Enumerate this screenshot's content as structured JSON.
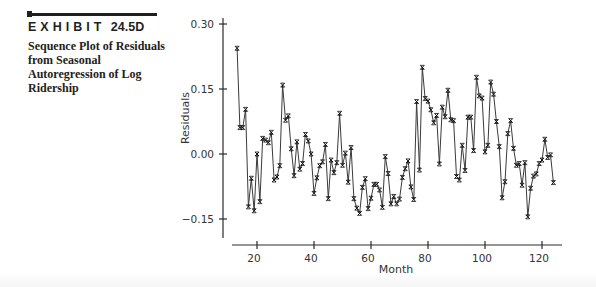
{
  "exhibit": {
    "word": "EXHIBIT",
    "number": "24.5D",
    "caption": "Sequence Plot of Residuals from Seasonal Autoregression of Log Ridership"
  },
  "chart_data": {
    "type": "line",
    "title": "Sequence Plot of Residuals from Seasonal Autoregression of Log Ridership",
    "xlabel": "Month",
    "ylabel": "Residuals",
    "xlim": [
      10,
      129
    ],
    "ylim": [
      -0.195,
      0.31
    ],
    "x_ticks": [
      20,
      40,
      60,
      80,
      100,
      120
    ],
    "x_tick_labels": [
      "20",
      "40",
      "60",
      "80",
      "100",
      "120"
    ],
    "y_ticks": [
      0.3,
      0.15,
      0.0,
      -0.15
    ],
    "y_tick_labels": [
      "0.30",
      "0.15",
      "0.00",
      "−0.15"
    ],
    "grid": false,
    "legend": null,
    "marker": "x",
    "series": [
      {
        "name": "Residuals",
        "x_start": 13,
        "x_step": 1,
        "values": [
          0.244,
          0.061,
          0.061,
          0.103,
          -0.122,
          -0.056,
          -0.131,
          0.0,
          -0.11,
          0.036,
          0.032,
          0.026,
          0.05,
          -0.06,
          -0.053,
          -0.027,
          0.159,
          0.078,
          0.088,
          0.012,
          -0.05,
          0.028,
          -0.035,
          -0.022,
          0.045,
          0.03,
          0.0,
          -0.091,
          -0.055,
          -0.027,
          -0.018,
          0.022,
          -0.103,
          -0.014,
          -0.043,
          -0.02,
          0.094,
          -0.026,
          0.002,
          -0.065,
          0.015,
          -0.103,
          -0.125,
          -0.137,
          -0.077,
          -0.057,
          -0.126,
          -0.102,
          -0.07,
          -0.07,
          -0.083,
          -0.123,
          -0.006,
          -0.045,
          -0.115,
          -0.098,
          -0.115,
          -0.104,
          -0.054,
          -0.034,
          -0.016,
          -0.076,
          -0.105,
          0.121,
          -0.037,
          0.2,
          0.128,
          0.122,
          0.102,
          0.072,
          0.089,
          -0.023,
          0.108,
          0.086,
          0.147,
          0.079,
          0.077,
          -0.052,
          -0.06,
          0.02,
          -0.038,
          0.085,
          0.085,
          0.008,
          0.177,
          0.134,
          0.129,
          0.005,
          0.02,
          0.166,
          0.138,
          0.075,
          0.017,
          -0.101,
          -0.064,
          0.047,
          0.077,
          0.013,
          -0.026,
          -0.022,
          -0.072,
          -0.02,
          -0.145,
          -0.079,
          -0.051,
          -0.046,
          -0.022,
          -0.014,
          0.034,
          -0.008,
          -0.002,
          -0.066
        ]
      }
    ]
  }
}
